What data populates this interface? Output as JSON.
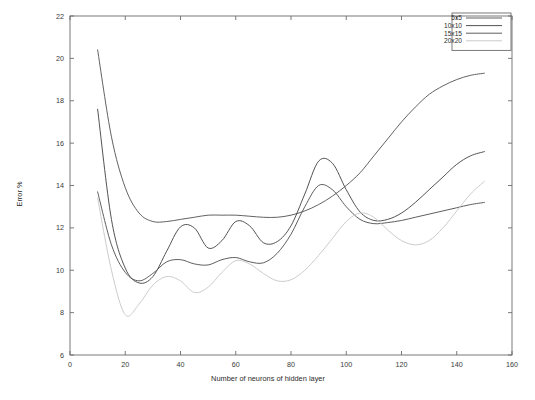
{
  "chart_data": {
    "type": "line",
    "title": "",
    "xlabel": "Number of neurons of hidden layer",
    "ylabel": "Error %",
    "xlim": [
      0,
      160
    ],
    "ylim": [
      6,
      22
    ],
    "xticks": [
      0,
      20,
      40,
      60,
      80,
      100,
      120,
      140,
      160
    ],
    "xtick_labels": [
      "0",
      "20",
      "40",
      "60",
      "80",
      "100",
      "120",
      "140",
      "160"
    ],
    "yticks": [
      6,
      8,
      10,
      12,
      14,
      16,
      18,
      20,
      22
    ],
    "ytick_labels": [
      "6",
      "8",
      "10",
      "12",
      "14",
      "16",
      "18",
      "20",
      "22"
    ],
    "grid": false,
    "legend_position": "top-right-inside",
    "x": [
      10,
      15,
      20,
      25,
      30,
      35,
      40,
      45,
      50,
      55,
      60,
      65,
      70,
      75,
      80,
      85,
      90,
      95,
      100,
      105,
      110,
      115,
      120,
      125,
      130,
      135,
      140,
      145,
      150
    ],
    "series": [
      {
        "name": "5x5",
        "color": "#5a5a5a",
        "values": [
          20.4,
          16.3,
          13.9,
          12.7,
          12.3,
          12.3,
          12.4,
          12.5,
          12.6,
          12.6,
          12.6,
          12.55,
          12.5,
          12.5,
          12.6,
          12.8,
          13.1,
          13.5,
          14.0,
          14.6,
          15.4,
          16.2,
          17.0,
          17.7,
          18.3,
          18.7,
          19.0,
          19.2,
          19.3
        ]
      },
      {
        "name": "10x10",
        "color": "#4a4a4a",
        "values": [
          17.6,
          12.4,
          10.1,
          9.4,
          9.7,
          10.9,
          12.05,
          12.0,
          11.05,
          11.4,
          12.3,
          12.1,
          11.3,
          11.35,
          12.1,
          13.6,
          15.15,
          15.05,
          13.8,
          12.75,
          12.35,
          12.4,
          12.7,
          13.2,
          13.8,
          14.4,
          15.0,
          15.4,
          15.6
        ]
      },
      {
        "name": "15x15",
        "color": "#555555",
        "values": [
          13.7,
          11.2,
          9.9,
          9.5,
          9.85,
          10.4,
          10.5,
          10.3,
          10.25,
          10.5,
          10.6,
          10.4,
          10.35,
          10.8,
          11.7,
          13.0,
          14.0,
          13.8,
          13.0,
          12.4,
          12.2,
          12.25,
          12.35,
          12.5,
          12.65,
          12.8,
          12.95,
          13.1,
          13.2
        ]
      },
      {
        "name": "20x20",
        "color": "#c8c8c8",
        "values": [
          13.4,
          10.0,
          7.9,
          8.4,
          9.3,
          9.7,
          9.5,
          8.95,
          9.2,
          9.9,
          10.45,
          10.3,
          9.85,
          9.5,
          9.55,
          10.0,
          10.7,
          11.5,
          12.3,
          12.7,
          12.5,
          11.9,
          11.4,
          11.2,
          11.4,
          12.0,
          12.8,
          13.6,
          14.2
        ]
      }
    ]
  },
  "legend": {
    "entries": [
      {
        "label": "5x5"
      },
      {
        "label": "10x10"
      },
      {
        "label": "15x15"
      },
      {
        "label": "20x20"
      }
    ]
  },
  "axes": {
    "x_title": "Number of neurons of hidden layer",
    "y_title": "Error %"
  }
}
